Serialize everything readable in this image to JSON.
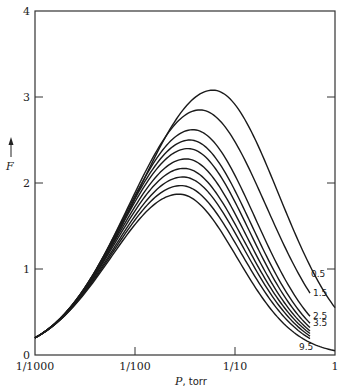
{
  "chart_data": {
    "type": "line",
    "title": "",
    "xlabel": "P, torr",
    "ylabel": "F",
    "xscale": "log",
    "xlim": [
      0.001,
      1
    ],
    "ylim": [
      0,
      4
    ],
    "x_ticks": [
      {
        "value": 0.001,
        "label": "1/1000"
      },
      {
        "value": 0.01,
        "label": "1/100"
      },
      {
        "value": 0.1,
        "label": "1/10"
      },
      {
        "value": 1,
        "label": "1"
      }
    ],
    "y_ticks": [
      {
        "value": 0,
        "label": "0"
      },
      {
        "value": 1,
        "label": "1"
      },
      {
        "value": 2,
        "label": "2"
      },
      {
        "value": 3,
        "label": "3"
      },
      {
        "value": 4,
        "label": "4"
      }
    ],
    "grid": false,
    "legend": "inline curve labels at right end",
    "series": [
      {
        "name": "0.5",
        "label": "0.5",
        "peak_logP": -1.22,
        "peak_F": 3.08,
        "start_F": 0.2,
        "end_logP": 0.0,
        "end_F": 0.55
      },
      {
        "name": "1.5",
        "label": "1.5",
        "peak_logP": -1.35,
        "peak_F": 2.85,
        "start_F": 0.2,
        "end_logP": -0.25,
        "end_F": 0.72
      },
      {
        "name": "2.5",
        "label": "2.5",
        "peak_logP": -1.42,
        "peak_F": 2.62,
        "start_F": 0.2,
        "end_logP": -0.25,
        "end_F": 0.45
      },
      {
        "name": "3.5",
        "label": "3.5",
        "peak_logP": -1.45,
        "peak_F": 2.5,
        "start_F": 0.2,
        "end_logP": -0.25,
        "end_F": 0.37
      },
      {
        "name": "4.5",
        "label": "",
        "peak_logP": -1.47,
        "peak_F": 2.4,
        "start_F": 0.2,
        "end_logP": -0.25,
        "end_F": 0.32
      },
      {
        "name": "5.5",
        "label": "",
        "peak_logP": -1.49,
        "peak_F": 2.28,
        "start_F": 0.2,
        "end_logP": -0.25,
        "end_F": 0.28
      },
      {
        "name": "6.5",
        "label": "",
        "peak_logP": -1.51,
        "peak_F": 2.17,
        "start_F": 0.2,
        "end_logP": -0.25,
        "end_F": 0.25
      },
      {
        "name": "7.5",
        "label": "",
        "peak_logP": -1.52,
        "peak_F": 2.07,
        "start_F": 0.2,
        "end_logP": -0.25,
        "end_F": 0.22
      },
      {
        "name": "8.5",
        "label": "",
        "peak_logP": -1.54,
        "peak_F": 1.97,
        "start_F": 0.2,
        "end_logP": -0.25,
        "end_F": 0.19
      },
      {
        "name": "9.5",
        "label": "9.5",
        "peak_logP": -1.56,
        "peak_F": 1.87,
        "start_F": 0.2,
        "end_logP": 0.0,
        "end_F": 0.05
      }
    ]
  },
  "axes": {
    "xlabel_italic": "P",
    "xlabel_rest": ", torr",
    "ylabel": "F",
    "ylabel_arrow": "↑"
  }
}
